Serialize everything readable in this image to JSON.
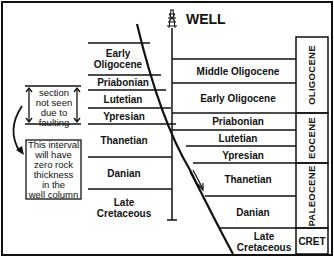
{
  "title": "WELL",
  "left_column": {
    "units": [
      {
        "label_line1": "Early",
        "label_line2": "Oligocene"
      },
      {
        "label_line1": "Priabonian"
      },
      {
        "label_line1": "Lutetian"
      },
      {
        "label_line1": "Ypresian"
      },
      {
        "label_line1": "Thanetian"
      },
      {
        "label_line1": "Danian"
      },
      {
        "label_line1": "Late",
        "label_line2": "Cretaceous"
      }
    ]
  },
  "right_column": {
    "units": [
      {
        "label": "Middle Oligocene"
      },
      {
        "label": "Early Oligocene"
      },
      {
        "label": "Priabonian"
      },
      {
        "label": "Lutetian"
      },
      {
        "label": "Ypresian"
      },
      {
        "label": "Thanetian"
      },
      {
        "label": "Danian"
      },
      {
        "label_line1": "Late",
        "label_line2": "Cretaceous"
      }
    ]
  },
  "periods": [
    {
      "label": "OLIGOCENE"
    },
    {
      "label": "EOCENE"
    },
    {
      "label": "PALEOCENE"
    },
    {
      "label": "CRET"
    }
  ],
  "annotations": {
    "missing_section": {
      "line1": "section",
      "line2": "not seen",
      "line3": "due to",
      "line4": "faulting"
    },
    "zero_thickness": {
      "line1": "This interval",
      "line2": "will have",
      "line3": "zero rock",
      "line4": "thickness",
      "line5": "in the",
      "line6": "well column"
    }
  },
  "colors": {
    "ink": "#111111",
    "background": "#ffffff"
  }
}
